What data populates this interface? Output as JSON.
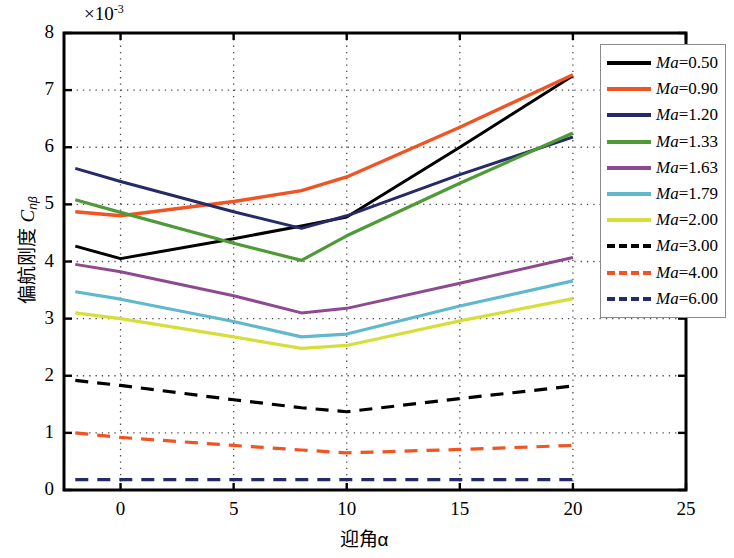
{
  "chart_data": {
    "type": "line",
    "title": "",
    "xlabel": "迎角α",
    "ylabel_prefix": "偏航刚度 ",
    "ylabel_symbol": "C",
    "ylabel_sub": "nβ",
    "y_multiplier": "×10",
    "y_multiplier_exp": "-3",
    "xlim": [
      -2.5,
      25
    ],
    "ylim": [
      0,
      8
    ],
    "xticks": [
      0,
      5,
      10,
      15,
      20,
      25
    ],
    "ytick_labels": [
      "0",
      "1",
      "2",
      "3",
      "4",
      "5",
      "6",
      "7",
      "8"
    ],
    "yticks": [
      0,
      1,
      2,
      3,
      4,
      5,
      6,
      7,
      8
    ],
    "grid": true,
    "grid_style": "dotted",
    "legend_position": "upper-right",
    "x": [
      -2,
      0,
      5,
      8,
      10,
      15,
      20
    ],
    "series": [
      {
        "name": "Ma=0.50",
        "label_prefix": "Ma",
        "label_value": "=0.50",
        "color": "#000000",
        "style": "solid",
        "width": 3.0,
        "values": [
          4.27,
          4.05,
          4.4,
          4.62,
          4.78,
          6.0,
          7.25
        ]
      },
      {
        "name": "Ma=0.90",
        "label_prefix": "Ma",
        "label_value": "=0.90",
        "color": "#F05423",
        "style": "solid",
        "width": 3.4,
        "values": [
          4.87,
          4.8,
          5.05,
          5.24,
          5.48,
          6.35,
          7.27
        ]
      },
      {
        "name": "Ma=1.20",
        "label_prefix": "Ma",
        "label_value": "=1.20",
        "color": "#252A68",
        "style": "solid",
        "width": 3.0,
        "values": [
          5.63,
          5.4,
          4.87,
          4.58,
          4.8,
          5.52,
          6.18
        ]
      },
      {
        "name": "Ma=1.33",
        "label_prefix": "Ma",
        "label_value": "=1.33",
        "color": "#4E9A36",
        "style": "solid",
        "width": 3.2,
        "values": [
          5.08,
          4.86,
          4.32,
          4.02,
          4.45,
          5.37,
          6.25
        ]
      },
      {
        "name": "Ma=1.63",
        "label_prefix": "Ma",
        "label_value": "=1.63",
        "color": "#8E4A8E",
        "style": "solid",
        "width": 3.0,
        "values": [
          3.95,
          3.82,
          3.4,
          3.1,
          3.18,
          3.62,
          4.07
        ]
      },
      {
        "name": "Ma=1.79",
        "label_prefix": "Ma",
        "label_value": "=1.79",
        "color": "#5FB8CC",
        "style": "solid",
        "width": 3.2,
        "values": [
          3.47,
          3.34,
          2.95,
          2.68,
          2.73,
          3.22,
          3.66
        ]
      },
      {
        "name": "Ma=2.00",
        "label_prefix": "Ma",
        "label_value": "=2.00",
        "color": "#D6DF3A",
        "style": "solid",
        "width": 3.2,
        "values": [
          3.1,
          3.0,
          2.68,
          2.48,
          2.53,
          2.96,
          3.35
        ]
      },
      {
        "name": "Ma=3.00",
        "label_prefix": "Ma",
        "label_value": "=3.00",
        "color": "#000000",
        "style": "dashed",
        "width": 3.2,
        "values": [
          1.92,
          1.83,
          1.58,
          1.44,
          1.37,
          1.6,
          1.82
        ]
      },
      {
        "name": "Ma=4.00",
        "label_prefix": "Ma",
        "label_value": "=4.00",
        "color": "#F05423",
        "style": "dashed",
        "width": 3.2,
        "values": [
          1.0,
          0.92,
          0.78,
          0.7,
          0.65,
          0.71,
          0.78
        ]
      },
      {
        "name": "Ma=6.00",
        "label_prefix": "Ma",
        "label_value": "=6.00",
        "color": "#252A68",
        "style": "dashed",
        "width": 3.2,
        "values": [
          0.18,
          0.18,
          0.18,
          0.18,
          0.18,
          0.18,
          0.18
        ]
      }
    ]
  }
}
